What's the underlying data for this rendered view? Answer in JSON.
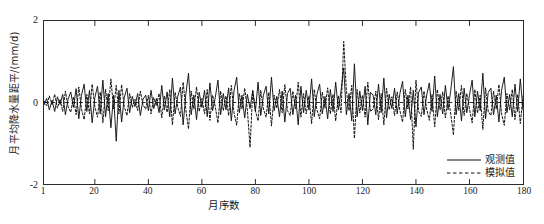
{
  "chart_data": {
    "type": "line",
    "title": "",
    "xlabel": "月序数",
    "ylabel": "月平均降水量距平/(mm/d)",
    "xlim": [
      1,
      180
    ],
    "ylim": [
      -2,
      2
    ],
    "xticks": [
      1,
      20,
      40,
      60,
      80,
      100,
      120,
      140,
      160,
      180
    ],
    "yticks": [
      -2,
      0,
      2
    ],
    "xticklabels": [
      "1",
      "20",
      "40",
      "60",
      "80",
      "100",
      "120",
      "140",
      "160",
      "180"
    ],
    "yticklabels": [
      "-2",
      "0",
      "2"
    ],
    "grid": false,
    "legend_position": "lower right",
    "zero_line": true,
    "series": [
      {
        "name": "观测值",
        "style": "solid",
        "color": "#111111",
        "values": [
          -0.06,
          0.1,
          -0.18,
          0.05,
          -0.22,
          0.14,
          -0.05,
          0.2,
          -0.3,
          0.08,
          0.26,
          -0.12,
          0.34,
          -0.4,
          0.18,
          0.45,
          -0.22,
          0.3,
          -0.5,
          0.12,
          0.4,
          -0.28,
          0.55,
          -0.35,
          0.22,
          -0.62,
          0.18,
          -0.95,
          0.3,
          -0.48,
          0.12,
          0.35,
          -0.25,
          0.15,
          -0.1,
          0.22,
          -0.32,
          0.08,
          0.18,
          -0.2,
          0.3,
          -0.15,
          0.1,
          -0.25,
          0.42,
          -0.18,
          0.26,
          -0.35,
          0.6,
          -0.28,
          0.15,
          0.38,
          -0.55,
          0.2,
          0.72,
          -0.3,
          0.18,
          -0.42,
          0.25,
          -0.12,
          0.3,
          -0.35,
          0.48,
          -0.2,
          0.12,
          0.55,
          -0.3,
          0.22,
          -0.18,
          0.36,
          -0.45,
          0.28,
          0.62,
          -0.25,
          0.18,
          -0.38,
          0.2,
          -0.15,
          0.3,
          -0.22,
          0.5,
          -0.32,
          0.18,
          0.4,
          -0.28,
          0.62,
          -0.2,
          0.15,
          -0.35,
          0.28,
          -0.48,
          0.22,
          0.35,
          -0.3,
          0.18,
          -0.55,
          0.4,
          -0.25,
          0.3,
          -0.18,
          0.58,
          -0.35,
          0.2,
          0.45,
          -0.28,
          0.15,
          -0.4,
          0.32,
          -0.22,
          0.5,
          -0.18,
          0.28,
          0.85,
          -0.3,
          0.22,
          -0.45,
          0.95,
          -0.35,
          0.28,
          -0.2,
          0.4,
          -0.55,
          0.25,
          0.18,
          -0.3,
          0.45,
          -0.25,
          0.6,
          -0.38,
          0.2,
          -0.15,
          0.35,
          -0.28,
          0.22,
          0.52,
          -0.35,
          0.18,
          -0.42,
          0.3,
          -0.6,
          0.25,
          0.38,
          -0.3,
          0.18,
          0.48,
          -0.22,
          0.65,
          -0.35,
          0.2,
          -0.28,
          0.42,
          -0.18,
          0.3,
          0.88,
          -0.3,
          0.22,
          -0.45,
          0.35,
          -0.25,
          0.18,
          0.55,
          -0.35,
          0.28,
          -0.2,
          0.72,
          -0.4,
          0.25,
          0.35,
          -0.3,
          0.18,
          -0.48,
          0.3,
          0.62,
          -0.25,
          0.2,
          -0.35,
          0.45,
          -0.22,
          0.58,
          -0.18
        ]
      },
      {
        "name": "模拟值",
        "style": "dashed",
        "color": "#111111",
        "values": [
          0.04,
          -0.08,
          0.16,
          -0.05,
          0.2,
          -0.14,
          0.08,
          -0.22,
          0.28,
          -0.1,
          -0.24,
          0.14,
          -0.3,
          0.38,
          -0.16,
          -0.42,
          0.2,
          -0.28,
          0.45,
          -0.1,
          -0.36,
          0.26,
          -0.5,
          0.32,
          -0.2,
          0.58,
          -0.16,
          0.42,
          -0.28,
          0.44,
          -0.1,
          -0.32,
          0.22,
          -0.12,
          0.08,
          -0.2,
          0.28,
          -0.06,
          -0.16,
          0.18,
          -0.28,
          0.12,
          -0.08,
          0.22,
          -0.38,
          0.16,
          -0.24,
          0.32,
          -0.55,
          0.25,
          -0.12,
          -0.34,
          0.5,
          -0.18,
          -0.65,
          0.28,
          -0.16,
          0.38,
          -0.22,
          0.1,
          -0.28,
          0.32,
          -0.44,
          0.18,
          -0.1,
          -0.5,
          0.28,
          -0.2,
          0.16,
          -0.32,
          0.42,
          -0.25,
          -0.56,
          0.22,
          -0.16,
          0.35,
          -0.18,
          -1.1,
          0.28,
          -0.2,
          -0.45,
          0.3,
          -0.16,
          -0.36,
          0.25,
          -0.58,
          0.18,
          -0.14,
          0.32,
          -0.25,
          0.44,
          -0.2,
          -0.32,
          0.28,
          -0.16,
          0.5,
          -0.36,
          0.22,
          -0.28,
          0.16,
          -0.52,
          0.32,
          -0.18,
          -0.4,
          0.25,
          -0.14,
          0.36,
          -0.28,
          0.2,
          -0.45,
          0.16,
          -0.25,
          1.5,
          0.28,
          -0.2,
          0.42,
          -0.88,
          0.32,
          -0.26,
          0.18,
          -0.36,
          0.5,
          -0.22,
          -0.16,
          0.28,
          -0.42,
          0.22,
          -0.55,
          0.35,
          -0.18,
          0.14,
          -0.32,
          0.26,
          -0.2,
          -0.48,
          0.32,
          -0.16,
          0.38,
          -1.15,
          0.55,
          -0.22,
          -0.34,
          0.28,
          -0.16,
          -0.44,
          0.2,
          -0.6,
          0.32,
          -0.18,
          0.26,
          -0.38,
          0.16,
          -0.28,
          -0.8,
          0.28,
          -0.2,
          0.42,
          -0.32,
          0.22,
          -0.16,
          -0.5,
          0.32,
          -0.26,
          0.18,
          -0.66,
          0.36,
          -0.22,
          -0.32,
          0.28,
          -0.16,
          0.44,
          -0.28,
          -0.56,
          0.22,
          -0.18,
          0.32,
          -0.42,
          0.2,
          -0.52,
          0.16
        ]
      }
    ]
  }
}
